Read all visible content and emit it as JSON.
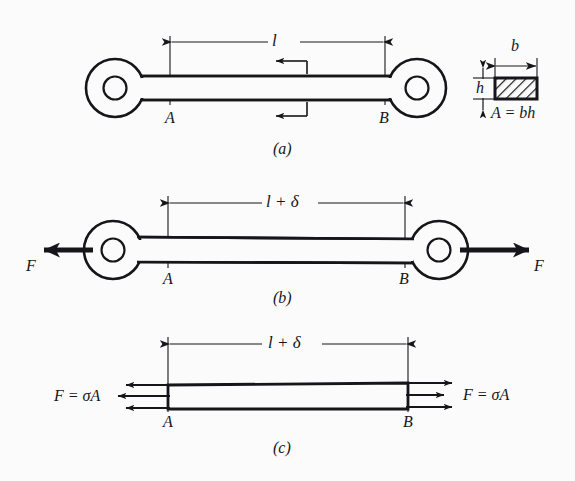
{
  "figure": {
    "background_color": "#fbfbfb",
    "ink_color": "#16161a",
    "panels": [
      {
        "id": "a",
        "caption": "(a)",
        "description": "Undeformed eye-bar of original length l between points A and B",
        "dimension_label": "l",
        "point_labels": [
          "A",
          "B"
        ],
        "has_leader_arrows": true
      },
      {
        "id": "b",
        "caption": "(b)",
        "description": "Eye-bar loaded in tension by forces F, stretched to length l + delta",
        "dimension_label": "l + δ",
        "point_labels": [
          "A",
          "B"
        ],
        "force_label_left": "F",
        "force_label_right": "F"
      },
      {
        "id": "c",
        "caption": "(c)",
        "description": "Free-body diagram of the bar showing uniformly distributed normal stress resultant",
        "dimension_label": "l + δ",
        "point_labels": [
          "A",
          "B"
        ],
        "force_label_left": "F = σA",
        "force_label_right": "F = σA",
        "stress_arrow_count_per_side": 3
      }
    ],
    "cross_section": {
      "width_label": "b",
      "height_label": "h",
      "area_equation": "A = bh",
      "hatched": true
    }
  }
}
